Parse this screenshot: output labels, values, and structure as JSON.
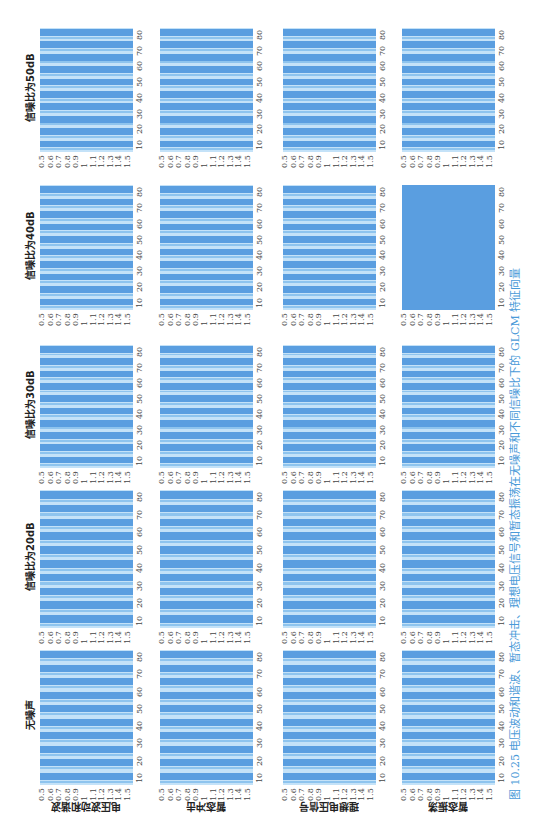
{
  "figure": {
    "caption": "图 10.25   电压波动和谐波、暂态冲击、理想电压信号和暂态振荡在无噪声和不同信噪比下的 GLCM 特征向量",
    "columns": [
      "无噪声",
      "信噪比为20dB",
      "信噪比为30dB",
      "信噪比为40dB",
      "信噪比为50dB"
    ],
    "rows": [
      "电压波动和谐波",
      "暂态冲击",
      "理想电压信号",
      "暂态振荡"
    ],
    "colors": {
      "dark": "#5a9ee0",
      "mid": "#8ec4ee",
      "light": "#c4e2f8",
      "caption": "#4a9ad8"
    }
  },
  "chart_data": {
    "type": "heatmap",
    "title": "图 10.25 电压波动和谐波、暂态冲击、理想电压信号和暂态振荡在无噪声和不同信噪比下的 GLCM 特征向量",
    "grid": {
      "rows": 4,
      "cols": 5
    },
    "row_labels": [
      "电压波动和谐波",
      "暂态冲击",
      "理想电压信号",
      "暂态振荡"
    ],
    "col_labels": [
      "无噪声",
      "信噪比为20dB",
      "信噪比为30dB",
      "信噪比为40dB",
      "信噪比为50dB"
    ],
    "x_ticks": [
      "0.5",
      "0.6",
      "0.7",
      "0.8",
      "0.9",
      "1",
      "1.1",
      "1.2",
      "1.3",
      "1.4",
      "1.5"
    ],
    "y_ticks": [
      "10",
      "20",
      "30",
      "40",
      "50",
      "60",
      "70",
      "80"
    ],
    "xlim": [
      0.5,
      1.5
    ],
    "ylim": [
      0,
      80
    ],
    "pattern": "banded stripes, ~10 dark bands alternating with light bands per panel; 暂态振荡@40dB nearly uniform dark"
  }
}
